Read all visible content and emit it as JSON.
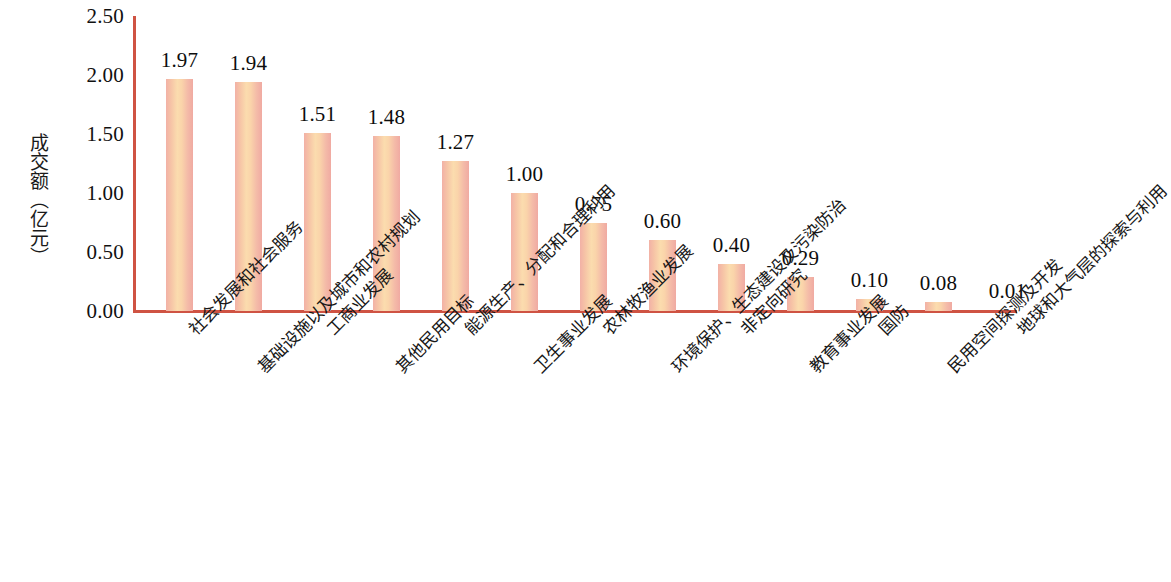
{
  "chart_data": {
    "type": "bar",
    "title": "",
    "subtitle": "",
    "xlabel": "",
    "ylabel": "成交额（亿元）",
    "ylim": [
      0,
      2.5
    ],
    "ytick_labels": [
      "2.50",
      "2.00",
      "1.50",
      "1.00",
      "0.50",
      "0.00"
    ],
    "ytick_values": [
      2.5,
      2.0,
      1.5,
      1.0,
      0.5,
      0.0
    ],
    "grid": false,
    "legend": null,
    "categories": [
      "社会发展和社会服务",
      "基础设施以及城市和农村规划",
      "工商业发展",
      "其他民用目标",
      "能源生产、分配和合理利用",
      "卫生事业发展",
      "农林牧渔业发展",
      "环境保护、生态建设及污染防治",
      "非定向研究",
      "教育事业发展",
      "国防",
      "民用空间探测及开发",
      "地球和大气层的探索与利用"
    ],
    "values": [
      1.97,
      1.94,
      1.51,
      1.48,
      1.27,
      1.0,
      0.75,
      0.6,
      0.4,
      0.29,
      0.1,
      0.08,
      0.01
    ],
    "value_labels": [
      "1.97",
      "1.94",
      "1.51",
      "1.48",
      "1.27",
      "1.00",
      "0.75",
      "0.60",
      "0.40",
      "0.29",
      "0.10",
      "0.08",
      "0.01"
    ],
    "colors": {
      "axis": "#cf5343",
      "bar_edge": "#f0aaa2",
      "bar_center": "#fbdcae",
      "text": "#111111",
      "background": "#ffffff"
    }
  }
}
